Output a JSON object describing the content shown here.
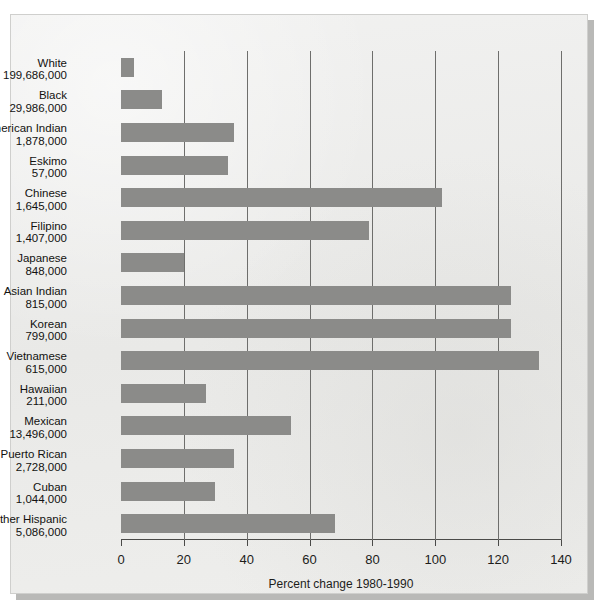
{
  "chart_data": {
    "type": "bar",
    "orientation": "horizontal",
    "title": "",
    "xlabel": "Percent change 1980-1990",
    "ylabel": "",
    "xlim": [
      0,
      140
    ],
    "xticks": [
      0,
      20,
      40,
      60,
      80,
      100,
      120,
      140
    ],
    "grid": true,
    "legend": null,
    "bar_color": "#8b8b89",
    "categories": [
      "White",
      "Black",
      "American Indian",
      "Eskimo",
      "Chinese",
      "Filipino",
      "Japanese",
      "Asian Indian",
      "Korean",
      "Vietnamese",
      "Hawaiian",
      "Mexican",
      "Puerto Rican",
      "Cuban",
      "Other Hispanic"
    ],
    "population_labels": [
      "199,686,000",
      "29,986,000",
      "1,878,000",
      "57,000",
      "1,645,000",
      "1,407,000",
      "848,000",
      "815,000",
      "799,000",
      "615,000",
      "211,000",
      "13,496,000",
      "2,728,000",
      "1,044,000",
      "5,086,000"
    ],
    "values": [
      4,
      13,
      36,
      34,
      102,
      79,
      20,
      124,
      124,
      133,
      27,
      54,
      36,
      30,
      68
    ]
  }
}
